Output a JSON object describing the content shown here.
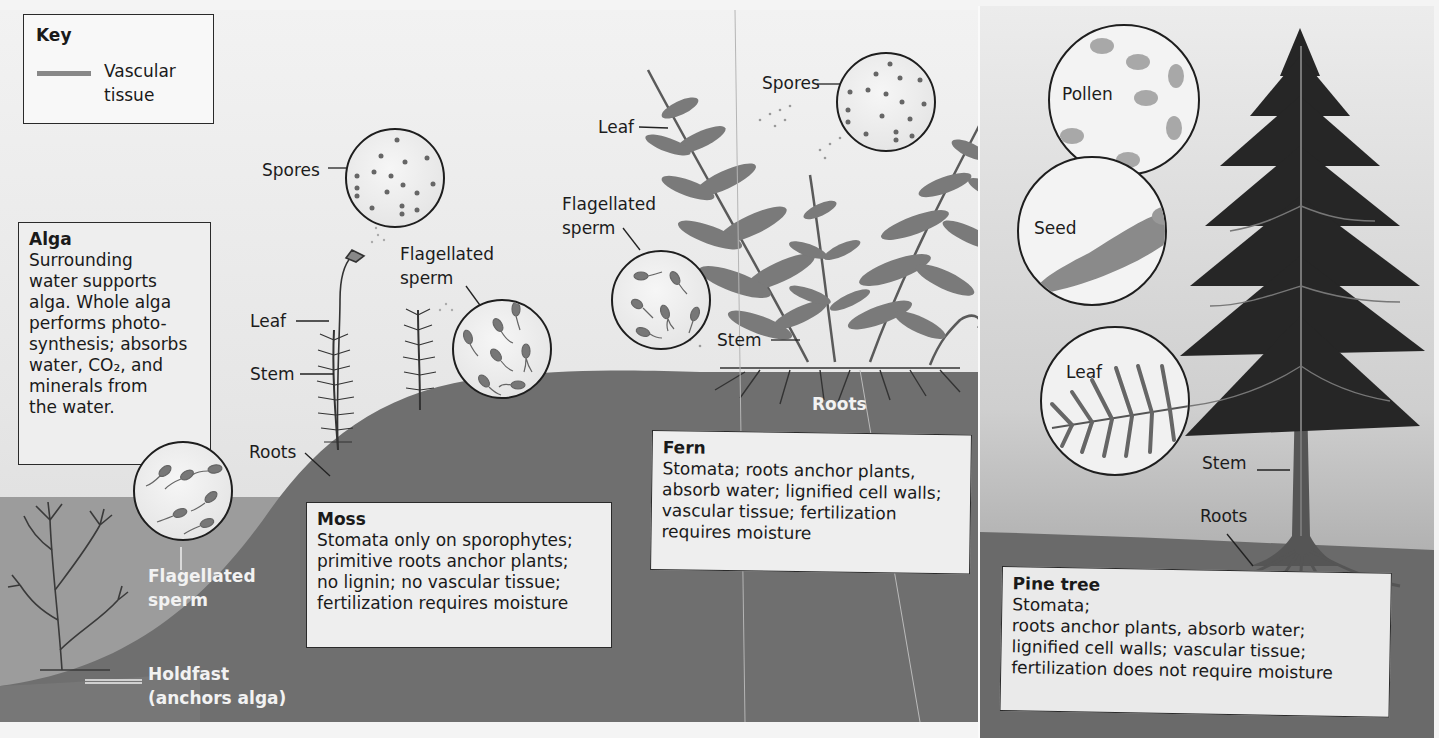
{
  "key": {
    "title": "Key",
    "swatch_color": "#888888",
    "entry_label_line1": "Vascular",
    "entry_label_line2": "tissue"
  },
  "alga": {
    "box": {
      "title": "Alga",
      "lines": [
        "Surrounding",
        "water supports",
        "alga. Whole alga",
        "performs photo-",
        "synthesis; absorbs",
        "water,  CO₂, and",
        "minerals from",
        "the water."
      ]
    },
    "labels": {
      "sperm_line1": "Flagellated",
      "sperm_line2": "sperm",
      "holdfast_line1": "Holdfast",
      "holdfast_line2": "(anchors alga)"
    }
  },
  "moss": {
    "labels": {
      "spores": "Spores",
      "sperm_line1": "Flagellated",
      "sperm_line2": "sperm",
      "leaf": "Leaf",
      "stem": "Stem",
      "roots": "Roots"
    },
    "box": {
      "title": "Moss",
      "lines": [
        "Stomata only on sporophytes;",
        "primitive roots anchor plants;",
        "no lignin;  no vascular tissue;",
        "fertilization requires moisture"
      ]
    }
  },
  "fern": {
    "labels": {
      "spores": "Spores",
      "leaf": "Leaf",
      "sperm_line1": "Flagellated",
      "sperm_line2": "sperm",
      "stem": "Stem",
      "roots": "Roots"
    },
    "box": {
      "title": "Fern",
      "lines": [
        "Stomata;  roots anchor plants,",
        "absorb water;  lignified cell walls;",
        "vascular tissue;  fertilization",
        "requires moisture"
      ]
    }
  },
  "pine": {
    "labels": {
      "pollen": "Pollen",
      "seed": "Seed",
      "leaf": "Leaf",
      "stem": "Stem",
      "roots": "Roots"
    },
    "box": {
      "title": "Pine tree",
      "lines": [
        "Stomata;",
        "roots anchor plants, absorb water;",
        "lignified cell walls;  vascular tissue;",
        "fertilization does not require moisture"
      ]
    }
  },
  "colors": {
    "water": "#9a9a9a",
    "soil": "#6e6e6e",
    "plant": "#555555",
    "tree": "#2a2a2a",
    "box_bg": "#eeeeee",
    "outline": "#1e1e1e"
  }
}
